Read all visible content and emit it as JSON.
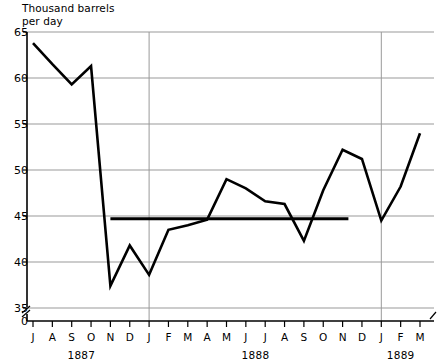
{
  "chart_data": {
    "type": "line",
    "title": "Thousand barrels\nper day",
    "xlabel": "",
    "ylabel": "Thousand barrels per day",
    "ylim": [
      35,
      65
    ],
    "yticks": [
      65,
      60,
      55,
      50,
      45,
      40,
      35
    ],
    "yticks_extra": [
      0
    ],
    "y_axis_break": true,
    "grid": true,
    "legend": "none",
    "categories": [
      "J",
      "A",
      "S",
      "O",
      "N",
      "D",
      "J",
      "F",
      "M",
      "A",
      "M",
      "J",
      "J",
      "A",
      "S",
      "O",
      "N",
      "D",
      "J",
      "F",
      "M"
    ],
    "year_groups": [
      {
        "label": "1887",
        "start_index": 0,
        "end_index": 5
      },
      {
        "label": "1888",
        "start_index": 6,
        "end_index": 17
      },
      {
        "label": "1889",
        "start_index": 18,
        "end_index": 20
      }
    ],
    "year_boundaries": [
      6,
      18
    ],
    "series": [
      {
        "name": "Production",
        "values": [
          63.8,
          61.5,
          59.3,
          61.3,
          37.4,
          41.8,
          38.6,
          43.5,
          44.0,
          44.6,
          49.0,
          48.0,
          46.6,
          46.3,
          42.3,
          47.8,
          52.2,
          51.2,
          44.5,
          48.2,
          54.0
        ]
      }
    ],
    "reference_lines": [
      {
        "name": "average-1887-88",
        "value": 44.7,
        "start_index": 4,
        "end_index": 16.3
      }
    ],
    "colors": {
      "line": "#000000",
      "grid": "#999999",
      "axis": "#000000",
      "background": "#ffffff"
    }
  }
}
